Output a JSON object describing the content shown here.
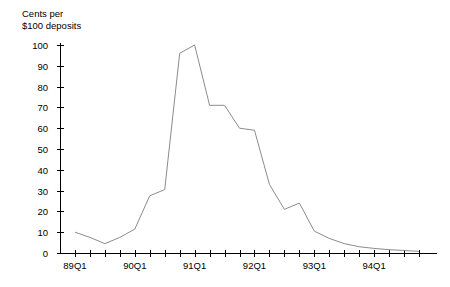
{
  "chart_data": {
    "type": "line",
    "title_line1": "Cents per",
    "title_line2": "$100 deposits",
    "xlabel": "",
    "ylabel": "Cents per $100 deposits",
    "ylim": [
      0,
      100
    ],
    "yticks": [
      0,
      10,
      20,
      30,
      40,
      50,
      60,
      70,
      80,
      90,
      100
    ],
    "ytick_labels": [
      "0",
      "10",
      "20",
      "30",
      "40",
      "50",
      "60",
      "70",
      "80",
      "90",
      "100"
    ],
    "xtick_labels": [
      "89Q1",
      "90Q1",
      "91Q1",
      "92Q1",
      "93Q1",
      "94Q1"
    ],
    "xtick_label_indices": [
      0,
      4,
      8,
      12,
      16,
      20
    ],
    "grid": false,
    "legend": false,
    "line_color": "#8c8c8c",
    "axis_color": "#000000",
    "x": [
      "89Q1",
      "89Q2",
      "89Q3",
      "89Q4",
      "90Q1",
      "90Q2",
      "90Q3",
      "90Q4",
      "91Q1",
      "91Q2",
      "91Q3",
      "91Q4",
      "92Q1",
      "92Q2",
      "92Q3",
      "92Q4",
      "93Q1",
      "93Q2",
      "93Q3",
      "93Q4",
      "94Q1",
      "94Q2",
      "94Q3",
      "94Q4"
    ],
    "values": [
      10.0,
      7.5,
      4.5,
      7.5,
      11.5,
      27.5,
      30.5,
      96.0,
      100.0,
      71.0,
      71.0,
      60.0,
      59.0,
      33.0,
      21.0,
      24.0,
      10.5,
      7.0,
      4.5,
      3.0,
      2.2,
      1.6,
      1.2,
      0.8
    ]
  }
}
